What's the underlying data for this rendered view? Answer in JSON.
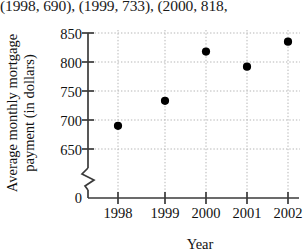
{
  "overflow_text": {
    "label": "(1998, 690), (1999, 733), (2000, 818,"
  },
  "chart_data": {
    "type": "scatter",
    "title": "",
    "xlabel": "Year",
    "ylabel": "Average monthly mortgage payment (in dollars)",
    "ylabel_line1": "Average monthly mortgage",
    "ylabel_line2": "payment (in dollars)",
    "categories": [
      "1998",
      "1999",
      "2000",
      "2001",
      "2002"
    ],
    "x": [
      1998,
      1999,
      2000,
      2001,
      2002
    ],
    "values": [
      690,
      733,
      818,
      792,
      835
    ],
    "points": [
      {
        "x": "1998",
        "y": 690
      },
      {
        "x": "1999",
        "y": 733
      },
      {
        "x": "2000",
        "y": 818
      },
      {
        "x": "2001",
        "y": 792
      },
      {
        "x": "2002",
        "y": 835
      }
    ],
    "ylim": [
      650,
      850
    ],
    "yticks": [
      850,
      800,
      750,
      700,
      650
    ],
    "y_zero_tick": "0",
    "y_axis_break": true,
    "xticks": [
      "1998",
      "1999",
      "2000",
      "2001",
      "2002"
    ],
    "grid": true,
    "grid_style": "dotted",
    "legend": null,
    "marker_color": "#000000",
    "axis_color": "#333333",
    "grid_color": "#bdbdbd"
  }
}
